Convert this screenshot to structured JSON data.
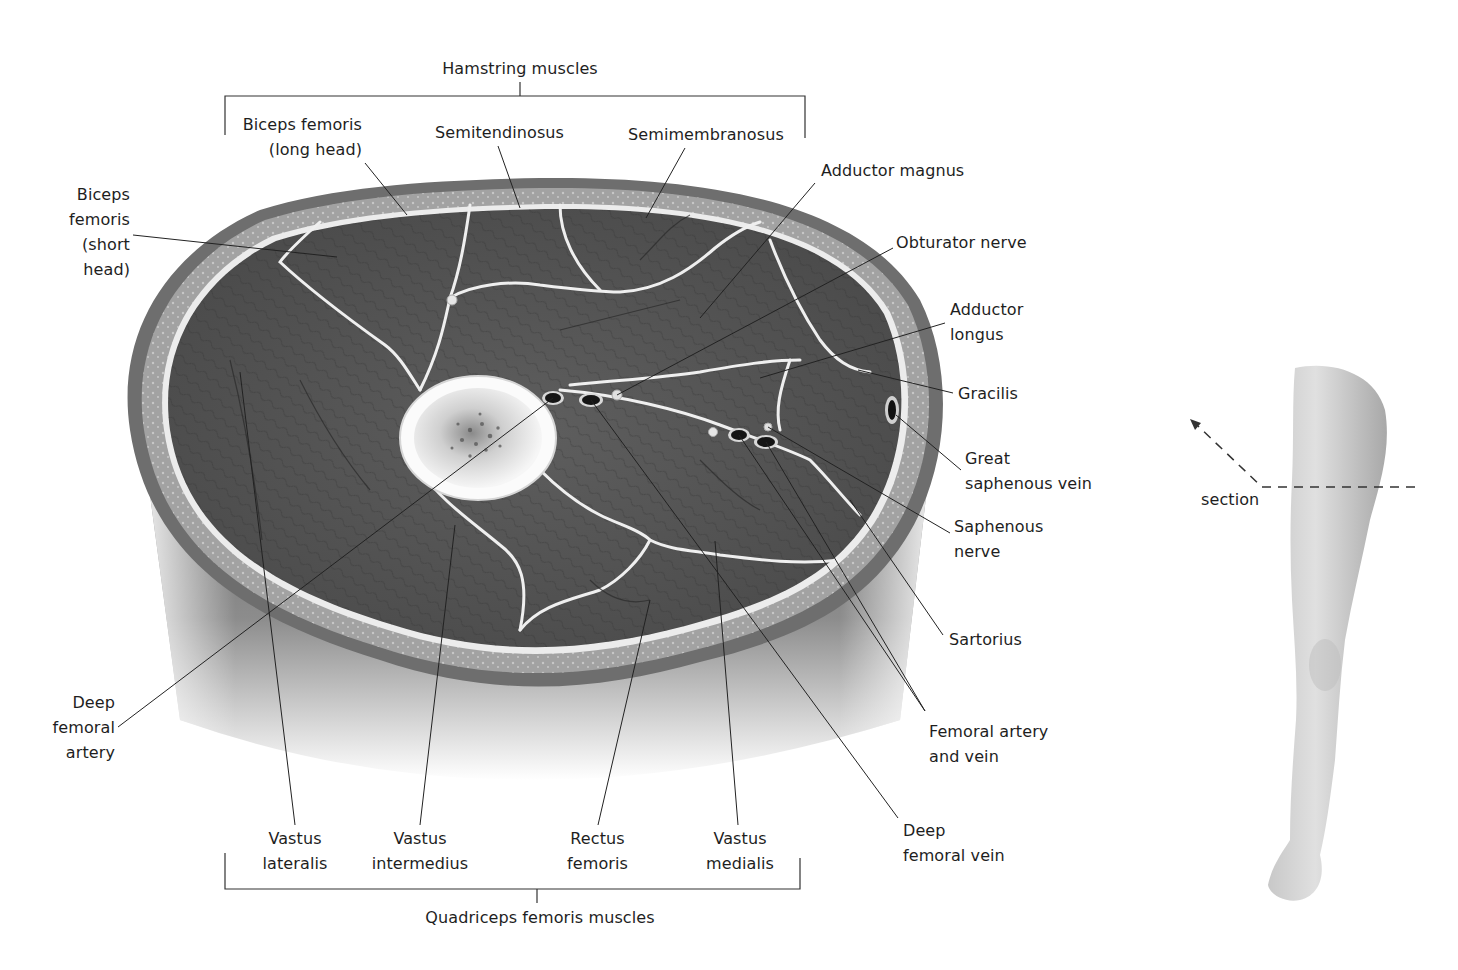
{
  "figure": {
    "colors": {
      "background": "#ffffff",
      "muscle": "#5a5a5a",
      "muscle_dark": "#3c3c3c",
      "fascia": "#e8e8e8",
      "subcutaneous_fat": "#9a9a9a",
      "skin": "#6e6e6e",
      "bone_outer": "#f0f0f0",
      "bone_marrow": "#7a7a7a",
      "vessel": "#1a1a1a",
      "leader_line": "#2a2a2a",
      "leg_skin": "#d4d4d4"
    }
  },
  "groups": {
    "hamstring": "Hamstring muscles",
    "quadriceps": "Quadriceps femoris muscles"
  },
  "labels": {
    "biceps_long": [
      "Biceps femoris",
      "(long head)"
    ],
    "semitendinosus": [
      "Semitendinosus"
    ],
    "semimembranosus": [
      "Semimembranosus"
    ],
    "adductor_magnus": [
      "Adductor magnus"
    ],
    "obturator_nerve": [
      "Obturator nerve"
    ],
    "biceps_short": [
      "Biceps",
      "femoris",
      "(short",
      "head)"
    ],
    "adductor_longus": [
      "Adductor",
      "longus"
    ],
    "gracilis": [
      "Gracilis"
    ],
    "great_saphenous_vein": [
      "Great",
      "saphenous vein"
    ],
    "saphenous_nerve": [
      "Saphenous",
      "nerve"
    ],
    "sartorius": [
      "Sartorius"
    ],
    "femoral_artery_vein": [
      "Femoral artery",
      "and vein"
    ],
    "deep_femoral_vein": [
      "Deep",
      "femoral vein"
    ],
    "deep_femoral_artery": [
      "Deep",
      "femoral",
      "artery"
    ],
    "vastus_lateralis": [
      "Vastus",
      "lateralis"
    ],
    "vastus_intermedius": [
      "Vastus",
      "intermedius"
    ],
    "rectus_femoris": [
      "Rectus",
      "femoris"
    ],
    "vastus_medialis": [
      "Vastus",
      "medialis"
    ]
  },
  "inset": {
    "section_label": "section"
  }
}
